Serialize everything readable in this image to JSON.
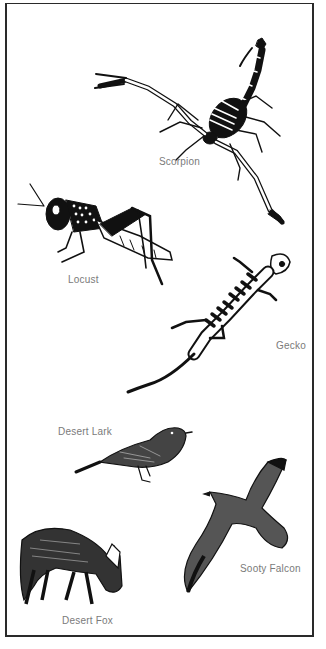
{
  "plate": {
    "animals": [
      {
        "name": "Scorpion",
        "label_x": 159,
        "label_y": 156
      },
      {
        "name": "Locust",
        "label_x": 68,
        "label_y": 274
      },
      {
        "name": "Gecko",
        "label_x": 276,
        "label_y": 340
      },
      {
        "name": "Desert Lark",
        "label_x": 58,
        "label_y": 426
      },
      {
        "name": "Sooty Falcon",
        "label_x": 240,
        "label_y": 563
      },
      {
        "name": "Desert Fox",
        "label_x": 62,
        "label_y": 615
      }
    ]
  },
  "colors": {
    "ink": "#111111",
    "label": "#7a7a7a",
    "border": "#2a2a2a",
    "background": "#ffffff"
  }
}
